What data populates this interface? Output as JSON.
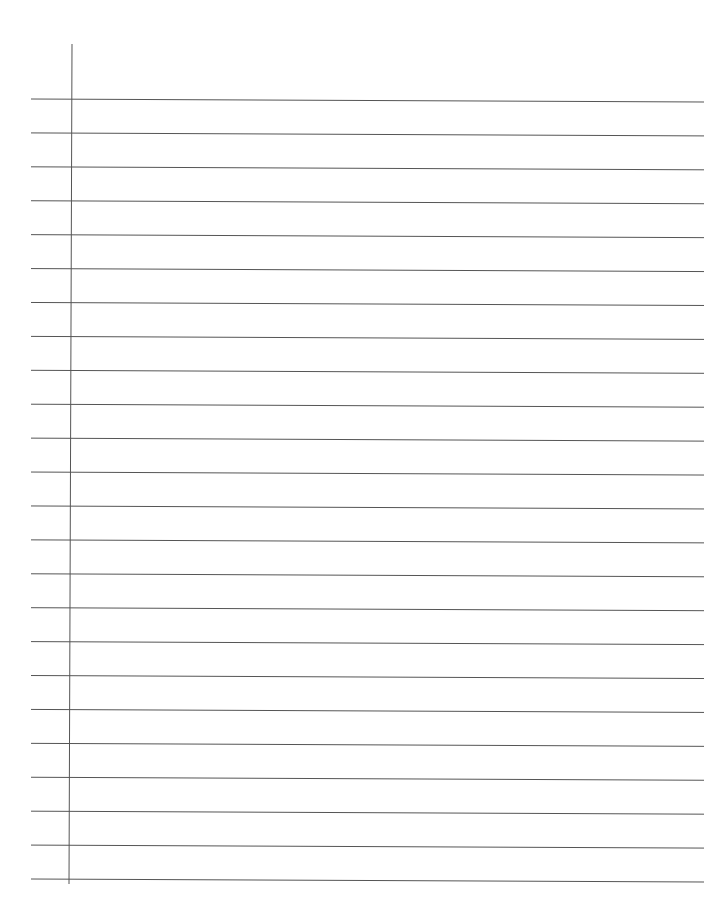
{
  "paper": {
    "type": "lined-paper",
    "background": "#ffffff",
    "line_color": "#555555",
    "margin_line_color": "#555555",
    "line_count": 24,
    "first_line_y_left": 99,
    "last_line_y_left": 879,
    "tilt_px": 3,
    "line_x_start": 31,
    "line_x_end": 704,
    "margin": {
      "x_top": 72,
      "y_top": 44,
      "x_bottom": 69,
      "y_bottom": 884
    }
  }
}
